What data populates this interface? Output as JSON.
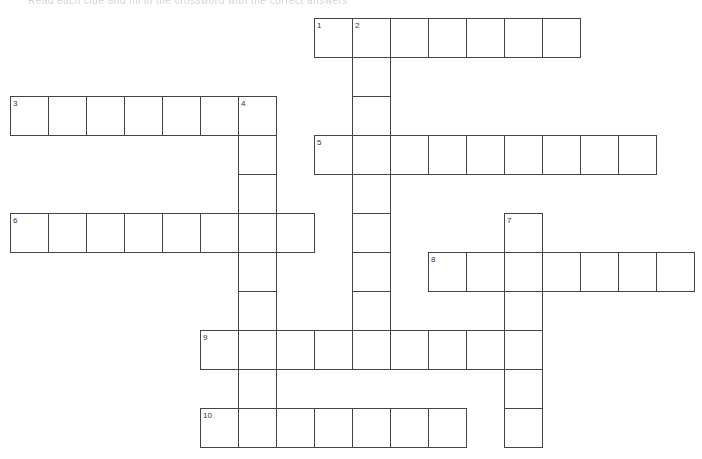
{
  "header": {
    "faded_text": "Read each clue and fill in the crossword with the correct answers"
  },
  "crossword": {
    "layout": {
      "origin_x": 10,
      "origin_y": 18,
      "cell_w": 38,
      "cell_h": 39,
      "cols": 18,
      "rows": 11
    },
    "entries": [
      {
        "number": "1",
        "direction": "across",
        "row": 0,
        "col": 8,
        "length": 7
      },
      {
        "number": "2",
        "direction": "down",
        "row": 0,
        "col": 9,
        "length": 9
      },
      {
        "number": "3",
        "direction": "across",
        "row": 2,
        "col": 0,
        "length": 7
      },
      {
        "number": "4",
        "direction": "down",
        "row": 2,
        "col": 6,
        "length": 9
      },
      {
        "number": "5",
        "direction": "across",
        "row": 3,
        "col": 8,
        "length": 9
      },
      {
        "number": "6",
        "direction": "across",
        "row": 5,
        "col": 0,
        "length": 8
      },
      {
        "number": "7",
        "direction": "down",
        "row": 5,
        "col": 13,
        "length": 6
      },
      {
        "number": "8",
        "direction": "across",
        "row": 6,
        "col": 11,
        "length": 7
      },
      {
        "number": "9",
        "direction": "across",
        "row": 8,
        "col": 5,
        "length": 9
      },
      {
        "number": "10",
        "direction": "across",
        "row": 10,
        "col": 5,
        "length": 7
      }
    ]
  }
}
